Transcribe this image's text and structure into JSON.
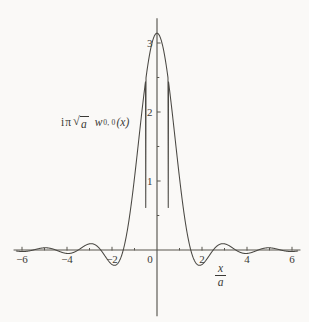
{
  "figure": {
    "background_color": "#faf9f7",
    "curve_color": "#4a4843",
    "axis_color": "#58564f",
    "y_axis_label_parts": {
      "i": "i",
      "pi": "π",
      "sqrt_sign": "√",
      "sqrt_radicand": "a",
      "w": "w",
      "w_subscript": "0, 0",
      "argument": "(x)"
    },
    "x_axis_label_parts": {
      "numerator": "x",
      "denominator": "a"
    }
  },
  "chart_data": {
    "type": "line",
    "title": "",
    "subtitle": "",
    "xlabel": "x/a",
    "ylabel": "iπ √a w0,0(x)",
    "xlim": [
      -6.35,
      6.35
    ],
    "ylim": [
      -0.95,
      3.35
    ],
    "grid": false,
    "legend": false,
    "legend_position": "none",
    "axis_style": "crossed-axes-at-origin",
    "xticks": [
      -6,
      -4,
      -2,
      0,
      2,
      4,
      6
    ],
    "xtick_labels": [
      "−6",
      "−4",
      "−2",
      "0",
      "2",
      "4",
      "6"
    ],
    "xminorticks": [
      -5,
      -3,
      -1,
      1,
      3,
      5
    ],
    "yticks": [
      1,
      2,
      3
    ],
    "ytick_labels": [
      "1",
      "2",
      "3"
    ],
    "yminorticks": [
      0.5,
      1.5,
      2.5
    ],
    "function_expression": "pi * cos(pi*x) / (1 - 4*x^2)",
    "x_domain": [
      -6.25,
      6.25
    ],
    "samples": 1100,
    "series": [
      {
        "name": "iπ √a w0,0(x)",
        "peak_value": 3.1416,
        "peak_x": 0,
        "zeros": [
          -5.5,
          -4.5,
          -3.5,
          -2.5,
          -1.5,
          1.5,
          2.5,
          3.5,
          4.5,
          5.5
        ],
        "extrema": [
          {
            "x": 0.0,
            "y": 3.1416
          },
          {
            "x": 2.06,
            "y": -0.72
          },
          {
            "x": 3.03,
            "y": 0.4
          },
          {
            "x": 4.02,
            "y": -0.28
          },
          {
            "x": 5.02,
            "y": 0.21
          },
          {
            "x": 6.0,
            "y": -0.18
          },
          {
            "x": -2.06,
            "y": -0.72
          },
          {
            "x": -3.03,
            "y": 0.4
          },
          {
            "x": -4.02,
            "y": -0.28
          },
          {
            "x": -5.02,
            "y": 0.21
          },
          {
            "x": -6.0,
            "y": -0.18
          }
        ]
      }
    ]
  }
}
